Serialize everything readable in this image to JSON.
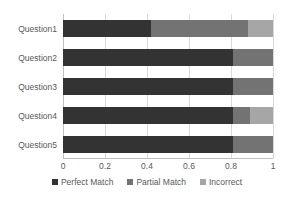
{
  "chart_data": {
    "type": "bar",
    "orientation": "horizontal",
    "stacked": true,
    "normalized": true,
    "title": "",
    "xlabel": "",
    "ylabel": "",
    "xlim": [
      0,
      1
    ],
    "grid": true,
    "legend_position": "bottom",
    "categories": [
      "Question1",
      "Question2",
      "Question3",
      "Question4",
      "Question5"
    ],
    "xticks": [
      "0",
      "0.2",
      "0.4",
      "0.6",
      "0.8",
      "1"
    ],
    "xtick_values": [
      0,
      0.2,
      0.4,
      0.6,
      0.8,
      1
    ],
    "series": [
      {
        "name": "Perfect Match",
        "color": "#333333",
        "values": [
          0.42,
          0.81,
          0.81,
          0.81,
          0.81
        ]
      },
      {
        "name": "Partial Match",
        "color": "#737373",
        "values": [
          0.46,
          0.19,
          0.19,
          0.08,
          0.19
        ]
      },
      {
        "name": "Incorrect",
        "color": "#a6a6a6",
        "values": [
          0.12,
          0.0,
          0.0,
          0.11,
          0.0
        ]
      }
    ]
  },
  "legend": {
    "items": [
      {
        "label": "Perfect Match",
        "color": "#333333",
        "swatch": "square-marker-icon"
      },
      {
        "label": "Partial Match",
        "color": "#737373",
        "swatch": "square-marker-icon"
      },
      {
        "label": "Incorrect",
        "color": "#a6a6a6",
        "swatch": "square-marker-icon"
      }
    ]
  },
  "axis": {
    "gridline_color": "#d9d9d9",
    "axis_color": "#bfbfbf"
  }
}
